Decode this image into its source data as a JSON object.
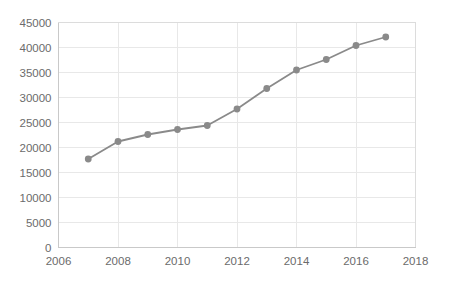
{
  "chart_data": {
    "type": "line",
    "title": "",
    "subtitle": "",
    "xlabel": "",
    "ylabel": "",
    "x": [
      2007,
      2008,
      2009,
      2010,
      2011,
      2012,
      2013,
      2014,
      2015,
      2016,
      2017
    ],
    "values": [
      17700,
      21200,
      22600,
      23600,
      24400,
      27700,
      31800,
      35500,
      37600,
      40400,
      42100
    ],
    "series": [
      {
        "name": "",
        "values": [
          17700,
          21200,
          22600,
          23600,
          24400,
          27700,
          31800,
          35500,
          37600,
          40400,
          42100
        ]
      }
    ],
    "xlim": [
      2006,
      2018
    ],
    "ylim": [
      0,
      45000
    ],
    "xticks": [
      2006,
      2008,
      2010,
      2012,
      2014,
      2016,
      2018
    ],
    "yticks": [
      0,
      5000,
      10000,
      15000,
      20000,
      25000,
      30000,
      35000,
      40000,
      45000
    ],
    "xtick_labels": [
      "2006",
      "2008",
      "2010",
      "2012",
      "2014",
      "2016",
      "2018"
    ],
    "ytick_labels": [
      "0",
      "5000",
      "10000",
      "15000",
      "20000",
      "25000",
      "30000",
      "35000",
      "40000",
      "45000"
    ],
    "grid": true,
    "grid_axis": "both",
    "legend": false,
    "legend_position": "none",
    "markers": true,
    "colors": {
      "line": "#8a8a8a",
      "marker": "#8a8a8a",
      "grid": "#e8e8e8",
      "axis": "#c9c9c9",
      "tick_text": "#6b6b6b",
      "background": "#ffffff"
    },
    "annotations": []
  }
}
